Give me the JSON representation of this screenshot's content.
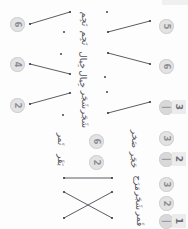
{
  "document": {
    "kind": "handwritten-matching-worksheet",
    "orientation": "rotated-90",
    "background_color": "#fdfdfd",
    "ink_color": "#53535c",
    "line_color": "#4a4a52",
    "badge_bg": "#e3e3e3",
    "badge_fg": "#8d8d94",
    "chip_bg": "#ececec",
    "chip_fg": "#6f6f77"
  },
  "left_badges": [
    {
      "id": "left-badge-6",
      "label": "6",
      "x": 10,
      "y": 17
    },
    {
      "id": "left-badge-4",
      "label": "4",
      "x": 10,
      "y": 57
    },
    {
      "id": "left-badge-2",
      "label": "2",
      "x": 10,
      "y": 98
    }
  ],
  "right_badges": [
    {
      "id": "right-badge-5",
      "label": "5",
      "x": 159,
      "y": 19
    },
    {
      "id": "right-badge-6",
      "label": "6",
      "x": 159,
      "y": 59
    },
    {
      "id": "right-badge-dash-3",
      "label": "",
      "x": 159,
      "y": 100,
      "style": "dash"
    },
    {
      "id": "right-badge-3",
      "label": "3",
      "x": 159,
      "y": 131
    },
    {
      "id": "right-badge-dash-2",
      "label": "",
      "x": 159,
      "y": 152,
      "style": "dash"
    },
    {
      "id": "right-badge-3b",
      "label": "3",
      "x": 159,
      "y": 177
    },
    {
      "id": "right-badge-2",
      "label": "2",
      "x": 159,
      "y": 196
    },
    {
      "id": "right-badge-dash-1",
      "label": "",
      "x": 159,
      "y": 214,
      "style": "dash"
    }
  ],
  "inline_badges": [
    {
      "id": "inline-badge-6",
      "label": "6",
      "x": 89,
      "y": 134
    },
    {
      "id": "inline-badge-2",
      "label": "2",
      "x": 89,
      "y": 155
    }
  ],
  "chips": [
    {
      "id": "chip-3",
      "label": "3",
      "x": 172,
      "y": 100
    },
    {
      "id": "chip-2",
      "label": "2",
      "x": 172,
      "y": 152
    },
    {
      "id": "chip-1",
      "label": "1",
      "x": 172,
      "y": 214
    }
  ],
  "script_items": [
    {
      "id": "script-1",
      "text": "ﻧَﺠِﻢ",
      "x": 78,
      "y": 14,
      "size": "normal"
    },
    {
      "id": "script-2",
      "text": "ﻧَﺠِﻢ",
      "x": 78,
      "y": 33,
      "size": "normal"
    },
    {
      "id": "script-3",
      "text": "ﺧِﻴﺎﻝ",
      "x": 74,
      "y": 55,
      "size": "normal"
    },
    {
      "id": "script-4",
      "text": "ﺧِﻴﺎﻝ",
      "x": 74,
      "y": 74,
      "size": "normal"
    },
    {
      "id": "script-5",
      "text": "ﺷَﺠَﺮ",
      "x": 76,
      "y": 95,
      "size": "normal"
    },
    {
      "id": "script-6",
      "text": "ﺷَﺠَﺮ",
      "x": 76,
      "y": 114,
      "size": "normal"
    },
    {
      "id": "script-7",
      "text": "ﺗَﻤﺮ",
      "x": 55,
      "y": 134,
      "size": "normal"
    },
    {
      "id": "script-8",
      "text": "ﺑَﻘَﺮ",
      "x": 55,
      "y": 155,
      "size": "normal"
    },
    {
      "id": "script-9",
      "text": "ﺻَﺨﺮ",
      "x": 126,
      "y": 134,
      "size": "normal"
    },
    {
      "id": "script-10",
      "text": "ﺣَﺠَﺮ",
      "x": 126,
      "y": 155,
      "size": "normal"
    },
    {
      "id": "script-11",
      "text": "ﻣَﺮَﺝ",
      "x": 130,
      "y": 178,
      "size": "normal"
    },
    {
      "id": "script-12",
      "text": "ﺷَﺠَﺮ",
      "x": 130,
      "y": 196,
      "size": "normal"
    },
    {
      "id": "script-13",
      "text": "ﻗَﻤﺮ",
      "x": 133,
      "y": 214,
      "size": "normal"
    }
  ],
  "connectors": [
    {
      "id": "connector-1",
      "x1": 30,
      "y1": 24,
      "x2": 70,
      "y2": 12
    },
    {
      "id": "connector-2",
      "x1": 108,
      "y1": 32,
      "x2": 150,
      "y2": 21
    },
    {
      "id": "connector-3",
      "x1": 108,
      "y1": 53,
      "x2": 150,
      "y2": 64
    },
    {
      "id": "connector-4",
      "x1": 30,
      "y1": 64,
      "x2": 70,
      "y2": 74
    },
    {
      "id": "connector-5",
      "x1": 30,
      "y1": 104,
      "x2": 70,
      "y2": 93
    },
    {
      "id": "connector-6",
      "x1": 108,
      "y1": 113,
      "x2": 150,
      "y2": 102
    },
    {
      "id": "connector-7",
      "x1": 64,
      "y1": 178,
      "x2": 112,
      "y2": 178
    },
    {
      "id": "connector-8",
      "x1": 64,
      "y1": 192,
      "x2": 112,
      "y2": 218
    },
    {
      "id": "connector-9",
      "x1": 64,
      "y1": 218,
      "x2": 112,
      "y2": 192
    }
  ],
  "ink_dots": [
    {
      "id": "dot-1",
      "x": 106,
      "y": 11
    },
    {
      "id": "dot-2",
      "x": 63,
      "y": 31
    },
    {
      "id": "dot-3",
      "x": 60,
      "y": 53
    },
    {
      "id": "dot-4",
      "x": 104,
      "y": 76
    },
    {
      "id": "dot-5",
      "x": 106,
      "y": 91
    },
    {
      "id": "dot-6",
      "x": 62,
      "y": 114
    }
  ]
}
